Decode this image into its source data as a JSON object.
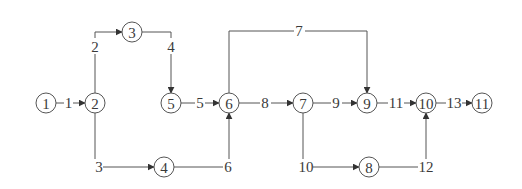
{
  "diagram": {
    "type": "activity-on-arrow network",
    "nodes": [
      {
        "id": "1",
        "label": "1",
        "x": 46,
        "y": 103
      },
      {
        "id": "2",
        "label": "2",
        "x": 95,
        "y": 103
      },
      {
        "id": "3",
        "label": "3",
        "x": 132,
        "y": 32
      },
      {
        "id": "4",
        "label": "4",
        "x": 164,
        "y": 167
      },
      {
        "id": "5",
        "label": "5",
        "x": 171,
        "y": 103
      },
      {
        "id": "6",
        "label": "6",
        "x": 229,
        "y": 103
      },
      {
        "id": "7",
        "label": "7",
        "x": 303,
        "y": 103
      },
      {
        "id": "8",
        "label": "8",
        "x": 369,
        "y": 167
      },
      {
        "id": "9",
        "label": "9",
        "x": 367,
        "y": 103
      },
      {
        "id": "10",
        "label": "10",
        "x": 426,
        "y": 103
      },
      {
        "id": "11",
        "label": "11",
        "x": 482,
        "y": 103
      }
    ],
    "edges": [
      {
        "id": "e1",
        "label": "1",
        "from": "1",
        "to": "2"
      },
      {
        "id": "e2",
        "label": "2",
        "from": "2",
        "to": "3"
      },
      {
        "id": "e3",
        "label": "3",
        "from": "2",
        "to": "4"
      },
      {
        "id": "e4",
        "label": "4",
        "from": "3",
        "to": "5"
      },
      {
        "id": "e5",
        "label": "5",
        "from": "5",
        "to": "6"
      },
      {
        "id": "e6",
        "label": "6",
        "from": "4",
        "to": "6"
      },
      {
        "id": "e7",
        "label": "7",
        "from": "6",
        "to": "9"
      },
      {
        "id": "e8",
        "label": "8",
        "from": "6",
        "to": "7"
      },
      {
        "id": "e9",
        "label": "9",
        "from": "7",
        "to": "9"
      },
      {
        "id": "e10",
        "label": "10",
        "from": "7",
        "to": "8"
      },
      {
        "id": "e11",
        "label": "11",
        "from": "9",
        "to": "10"
      },
      {
        "id": "e12",
        "label": "12",
        "from": "8",
        "to": "10"
      },
      {
        "id": "e13",
        "label": "13",
        "from": "10",
        "to": "11"
      }
    ]
  },
  "colors": {
    "line": "#555555",
    "text": "#3a3a3a",
    "background": "#ffffff"
  }
}
